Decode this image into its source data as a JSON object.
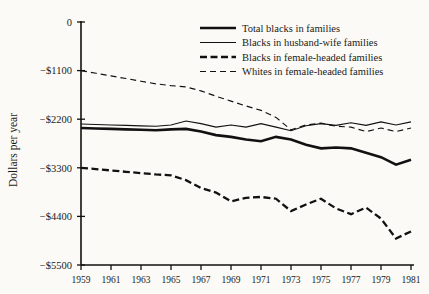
{
  "chart_data": {
    "type": "line",
    "title": "",
    "xlabel": "",
    "ylabel": "Dollars per year",
    "xlim": [
      1959,
      1981
    ],
    "ylim": [
      -5500,
      0
    ],
    "grid": false,
    "legend_position": "top-right",
    "x": [
      1959,
      1960,
      1961,
      1962,
      1963,
      1964,
      1965,
      1966,
      1967,
      1968,
      1969,
      1970,
      1971,
      1972,
      1973,
      1974,
      1975,
      1976,
      1977,
      1978,
      1979,
      1980,
      1981
    ],
    "yticks": [
      0,
      -1100,
      -2200,
      -3300,
      -4400,
      -5500
    ],
    "ytick_labels": [
      "0",
      "−$1100",
      "−$2200",
      "−$3300",
      "−$4400",
      "−$5500"
    ],
    "xticks": [
      1959,
      1961,
      1963,
      1965,
      1967,
      1969,
      1971,
      1973,
      1975,
      1977,
      1979,
      1981
    ],
    "xtick_labels": [
      "1959",
      "1961",
      "1963",
      "1965",
      "1967",
      "1969",
      "1971",
      "1973",
      "1975",
      "1977",
      "1979",
      "1981"
    ],
    "series": [
      {
        "name": "Total blacks in families",
        "style": "thick-solid",
        "stroke_width": 2.6,
        "dash": "",
        "values": [
          -2400,
          -2410,
          -2420,
          -2430,
          -2440,
          -2450,
          -2430,
          -2420,
          -2480,
          -2560,
          -2600,
          -2660,
          -2700,
          -2600,
          -2660,
          -2780,
          -2860,
          -2840,
          -2860,
          -2960,
          -3060,
          -3230,
          -3120
        ]
      },
      {
        "name": "Blacks in husband-wife families",
        "style": "thin-solid",
        "stroke_width": 1.1,
        "dash": "",
        "values": [
          -2310,
          -2320,
          -2330,
          -2340,
          -2350,
          -2360,
          -2330,
          -2240,
          -2300,
          -2380,
          -2330,
          -2380,
          -2300,
          -2380,
          -2460,
          -2350,
          -2300,
          -2340,
          -2280,
          -2340,
          -2260,
          -2330,
          -2260
        ]
      },
      {
        "name": "Blacks in female-headed families",
        "style": "thick-dashed",
        "stroke_width": 2.3,
        "dash": "7,3.5",
        "values": [
          -3300,
          -3330,
          -3360,
          -3390,
          -3420,
          -3450,
          -3470,
          -3580,
          -3760,
          -3860,
          -4060,
          -3980,
          -3960,
          -4000,
          -4280,
          -4130,
          -4000,
          -4220,
          -4350,
          -4200,
          -4450,
          -4900,
          -4740
        ]
      },
      {
        "name": "Whites in female-headed families",
        "style": "thin-dashed",
        "stroke_width": 1.15,
        "dash": "6,4",
        "values": [
          -1100,
          -1160,
          -1220,
          -1280,
          -1340,
          -1400,
          -1440,
          -1470,
          -1560,
          -1680,
          -1790,
          -1900,
          -2000,
          -2160,
          -2440,
          -2330,
          -2290,
          -2360,
          -2380,
          -2480,
          -2400,
          -2480,
          -2400
        ]
      }
    ]
  },
  "legend": {
    "items": [
      {
        "label": "Total blacks in families"
      },
      {
        "label": "Blacks in husband-wife families"
      },
      {
        "label": "Blacks in female-headed families"
      },
      {
        "label": "Whites in female-headed families"
      }
    ]
  }
}
